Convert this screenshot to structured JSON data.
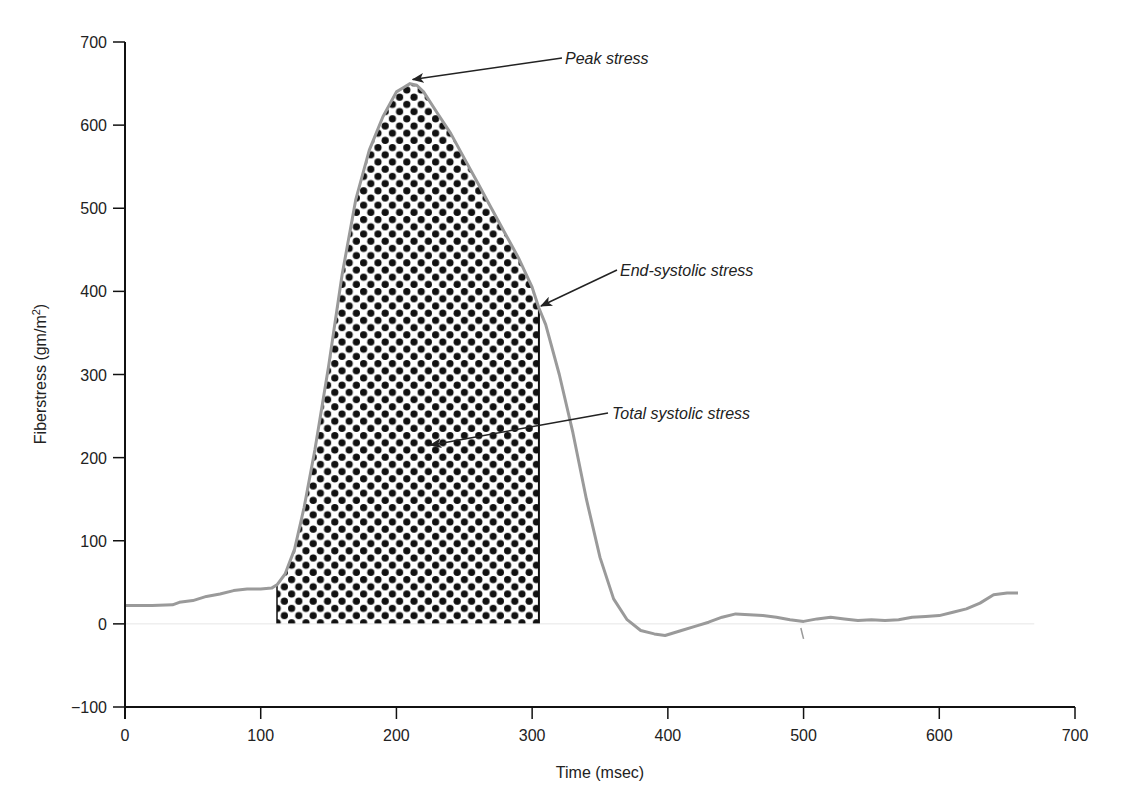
{
  "chart_data": {
    "type": "line",
    "title": "",
    "xlabel": "Time (msec)",
    "ylabel": "Fiberstress (gm/m²)",
    "ylabel_base": "Fiberstress (gm/m",
    "ylabel_sup": "2",
    "ylabel_tail": ")",
    "xlim": [
      0,
      700
    ],
    "ylim": [
      -100,
      700
    ],
    "xticks": [
      0,
      100,
      200,
      300,
      400,
      500,
      600,
      700
    ],
    "yticks": [
      -100,
      0,
      100,
      200,
      300,
      400,
      500,
      600,
      700
    ],
    "xtick_labels": [
      "0",
      "100",
      "200",
      "300",
      "400",
      "500",
      "600",
      "700"
    ],
    "ytick_labels": [
      "−100",
      "0",
      "100",
      "200",
      "300",
      "400",
      "500",
      "600",
      "700"
    ],
    "grid": false,
    "legend": null,
    "line_color": "#9a9a9a",
    "series": [
      {
        "name": "Fiberstress",
        "x": [
          0,
          20,
          35,
          40,
          50,
          60,
          70,
          80,
          90,
          100,
          108,
          112,
          118,
          125,
          132,
          140,
          150,
          160,
          170,
          180,
          190,
          200,
          205,
          210,
          215,
          220,
          230,
          240,
          250,
          260,
          270,
          280,
          290,
          300,
          305,
          310,
          320,
          330,
          340,
          350,
          360,
          370,
          380,
          390,
          398,
          410,
          420,
          430,
          440,
          450,
          460,
          470,
          480,
          490,
          500,
          510,
          520,
          530,
          540,
          550,
          560,
          570,
          580,
          590,
          600,
          610,
          620,
          630,
          640,
          650,
          658
        ],
        "y": [
          22,
          22,
          23,
          26,
          28,
          33,
          36,
          40,
          42,
          42,
          43,
          47,
          60,
          90,
          140,
          210,
          310,
          420,
          510,
          570,
          610,
          640,
          645,
          650,
          648,
          640,
          615,
          590,
          560,
          530,
          500,
          470,
          440,
          405,
          380,
          360,
          300,
          230,
          150,
          80,
          30,
          5,
          -8,
          -12,
          -14,
          -8,
          -3,
          2,
          8,
          12,
          11,
          10,
          8,
          5,
          3,
          6,
          8,
          6,
          4,
          5,
          4,
          5,
          8,
          9,
          10,
          14,
          18,
          25,
          35,
          37,
          37
        ]
      }
    ],
    "shaded_region": {
      "label": "Total systolic stress",
      "x_start": 112,
      "x_end": 305,
      "pattern": "black dots"
    },
    "annotations": [
      {
        "text": "Peak stress",
        "x": 212,
        "y": 650
      },
      {
        "text": "End-systolic stress",
        "x": 305,
        "y": 380
      },
      {
        "text": "Total systolic stress",
        "x": 225,
        "y": 215
      }
    ]
  }
}
